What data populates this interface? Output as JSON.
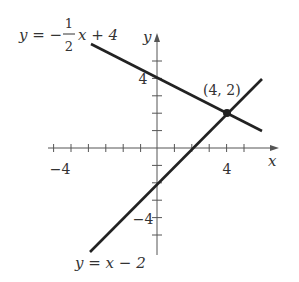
{
  "figure": {
    "x_axis_label": "x",
    "y_axis_label": "y",
    "x_tick_labels": [
      {
        "value": -4,
        "text": "−4"
      },
      {
        "value": 4,
        "text": "4"
      }
    ],
    "y_tick_labels": [
      {
        "value": 4,
        "text": "4"
      },
      {
        "value": -4,
        "text": "−4"
      }
    ],
    "x_range": [
      -6,
      7
    ],
    "y_range": [
      -6,
      7
    ],
    "lines": [
      {
        "name": "line-1",
        "equation_prefix": "y = −",
        "fraction_numerator": "1",
        "fraction_denominator": "2",
        "equation_suffix": "x + 4",
        "slope": -0.5,
        "intercept": 4,
        "x_from": -3.8,
        "x_to": 6,
        "color": "#222222"
      },
      {
        "name": "line-2",
        "equation": "y = x − 2",
        "slope": 1,
        "intercept": -2,
        "x_from": -3.85,
        "x_to": 6.05,
        "color": "#222222"
      }
    ],
    "intersection": {
      "x": 4,
      "y": 2,
      "label": "(4, 2)"
    }
  }
}
